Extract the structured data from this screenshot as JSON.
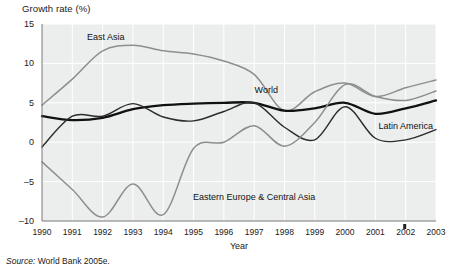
{
  "chart_data": {
    "type": "line",
    "title": "",
    "ylabel": "Growth rate (%)",
    "xlabel": "Year",
    "ylim": [
      -10,
      15
    ],
    "yticks": [
      15,
      10,
      5,
      0,
      -5,
      -10
    ],
    "ytick_labels": [
      "15",
      "10",
      "5",
      "0",
      "–5",
      "–10"
    ],
    "grid": true,
    "legend_position": "inline-annotations",
    "x": [
      1990,
      1991,
      1992,
      1993,
      1994,
      1995,
      1996,
      1997,
      1998,
      1999,
      2000,
      2001,
      2002,
      2003
    ],
    "xtick_labels": [
      "1990",
      "1991",
      "1992",
      "1993",
      "1994",
      "1995",
      "1996",
      "1997",
      "1998",
      "1999",
      "2000",
      "2001",
      "2002",
      "2003"
    ],
    "series": [
      {
        "name": "East Asia",
        "color": "#8e8e8e",
        "label_x": 1992.1,
        "label_y": 13.4,
        "values": [
          4.7,
          8.0,
          11.6,
          12.3,
          11.6,
          11.2,
          10.3,
          8.6,
          4.0,
          6.4,
          7.5,
          5.8,
          6.9,
          7.9
        ]
      },
      {
        "name": "World",
        "color": "#111111",
        "label_x": 1997.4,
        "label_y": 6.6,
        "values": [
          3.3,
          2.8,
          3.1,
          4.2,
          4.7,
          4.9,
          5.0,
          5.0,
          4.0,
          4.3,
          5.0,
          3.6,
          4.3,
          5.3
        ]
      },
      {
        "name": "Latin America",
        "color": "#2b2b2b",
        "label_x": 2002.0,
        "label_y": 2.1,
        "values": [
          -0.6,
          3.3,
          3.3,
          4.9,
          3.2,
          2.7,
          3.9,
          5.0,
          1.9,
          0.3,
          4.5,
          0.5,
          0.3,
          1.6
        ]
      },
      {
        "name": "Eastern Europe & Central Asia",
        "color": "#8e8e8e",
        "label_x": 1997.0,
        "label_y": -6.9,
        "values": [
          -2.5,
          -6.0,
          -9.5,
          -5.3,
          -9.2,
          -0.8,
          0.0,
          2.1,
          -0.5,
          2.5,
          7.3,
          5.8,
          5.3,
          6.5
        ]
      }
    ]
  },
  "source": {
    "prefix": "Source:",
    "text": " World Bank 2005e."
  }
}
